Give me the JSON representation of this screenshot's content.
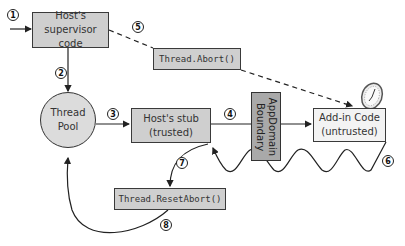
{
  "nodes": {
    "supervisor": {
      "line1": "Host's",
      "line2": "supervisor code"
    },
    "thread_abort": {
      "label": "Thread.Abort()"
    },
    "thread_pool": {
      "line1": "Thread",
      "line2": "Pool"
    },
    "host_stub": {
      "line1": "Host's stub",
      "line2": "(trusted)"
    },
    "boundary": {
      "label": "AppDomain\nBoundary"
    },
    "addin": {
      "line1": "Add-in Code",
      "line2": "(untrusted)"
    },
    "reset_abort": {
      "label": "Thread.ResetAbort()"
    }
  },
  "steps": [
    "1",
    "2",
    "3",
    "4",
    "5",
    "6",
    "7",
    "8"
  ],
  "colors": {
    "box_gray": "#cfcfcf",
    "box_light": "#f3f3f3",
    "boundary": "#a9a9a9",
    "stroke": "#333333"
  }
}
